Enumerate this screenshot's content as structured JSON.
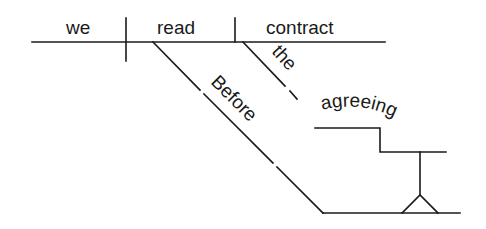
{
  "diagram": {
    "type": "sentence-diagram",
    "words": {
      "subject": "we",
      "verb": "read",
      "object": "contract",
      "object_modifier": "the",
      "preposition": "Before",
      "gerund": "agreeing"
    },
    "colors": {
      "ink": "#1a1a1a",
      "background": "#ffffff"
    }
  }
}
